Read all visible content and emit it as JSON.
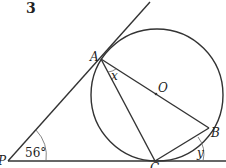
{
  "question_number": "3",
  "points": {
    "A": "A",
    "B": "B",
    "C": "C",
    "O": "O",
    "P": "P"
  },
  "angles": {
    "P": "56°",
    "x": "x",
    "y": "y"
  }
}
